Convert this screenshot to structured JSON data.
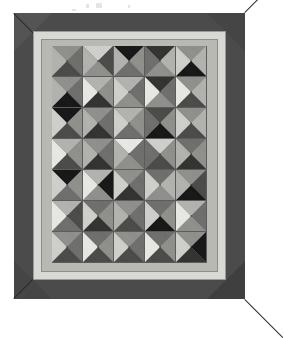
{
  "scene": {
    "title": "Framed geometric grid artwork",
    "background_color": "#ffffff"
  },
  "frame": {
    "name": "picture-frame",
    "color": "#4b4b4b",
    "miter_light_color": "#545454",
    "miter_dark_color": "#3f3f3f",
    "miter_line_color": "#2a2a2a",
    "width_px": 231,
    "height_px": 286
  },
  "mat": {
    "outer_color": "#d8d8d4",
    "outer_edge_color": "#9a9a96",
    "inner_color": "#b9b9b4",
    "inner_edge_color": "#8d8d89"
  },
  "artwork": {
    "label": "pyramid-tile-grid",
    "columns": 5,
    "rows": 7,
    "tile_size_px": 31,
    "grout_color": "#5c5c5c",
    "palette": {
      "white": "#e8e8e4",
      "light": "#cfcfcb",
      "light_mid": "#b2b2ae",
      "mid": "#8f8f8c",
      "mid_dark": "#6e6e6c",
      "dark": "#4a4a49",
      "darker": "#323231",
      "black": "#161616"
    },
    "tiles": [
      {
        "r": 0,
        "c": 0,
        "top": "#8f8f8c",
        "right": "#6e6e6c",
        "bottom": "#4a4a49",
        "left": "#b2b2ae"
      },
      {
        "r": 0,
        "c": 1,
        "top": "#cfcfcb",
        "right": "#4a4a49",
        "bottom": "#8f8f8c",
        "left": "#b2b2ae"
      },
      {
        "r": 0,
        "c": 2,
        "top": "#161616",
        "right": "#8f8f8c",
        "bottom": "#6e6e6c",
        "left": "#b2b2ae"
      },
      {
        "r": 0,
        "c": 3,
        "top": "#323231",
        "right": "#b2b2ae",
        "bottom": "#8f8f8c",
        "left": "#6e6e6c"
      },
      {
        "r": 0,
        "c": 4,
        "top": "#8f8f8c",
        "right": "#b2b2ae",
        "bottom": "#161616",
        "left": "#cfcfcb"
      },
      {
        "r": 1,
        "c": 0,
        "top": "#8f8f8c",
        "right": "#6e6e6c",
        "bottom": "#161616",
        "left": "#b2b2ae"
      },
      {
        "r": 1,
        "c": 1,
        "top": "#b2b2ae",
        "right": "#8f8f8c",
        "bottom": "#323231",
        "left": "#e8e8e4"
      },
      {
        "r": 1,
        "c": 2,
        "top": "#b2b2ae",
        "right": "#6e6e6c",
        "bottom": "#8f8f8c",
        "left": "#cfcfcb"
      },
      {
        "r": 1,
        "c": 3,
        "top": "#323231",
        "right": "#6e6e6c",
        "bottom": "#8f8f8c",
        "left": "#e8e8e4"
      },
      {
        "r": 1,
        "c": 4,
        "top": "#8f8f8c",
        "right": "#b2b2ae",
        "bottom": "#4a4a49",
        "left": "#e8e8e4"
      },
      {
        "r": 2,
        "c": 0,
        "top": "#161616",
        "right": "#8f8f8c",
        "bottom": "#4a4a49",
        "left": "#cfcfcb"
      },
      {
        "r": 2,
        "c": 1,
        "top": "#8f8f8c",
        "right": "#6e6e6c",
        "bottom": "#323231",
        "left": "#b2b2ae"
      },
      {
        "r": 2,
        "c": 2,
        "top": "#b2b2ae",
        "right": "#8f8f8c",
        "bottom": "#6e6e6c",
        "left": "#cfcfcb"
      },
      {
        "r": 2,
        "c": 3,
        "top": "#4a4a49",
        "right": "#8f8f8c",
        "bottom": "#161616",
        "left": "#6e6e6c"
      },
      {
        "r": 2,
        "c": 4,
        "top": "#8f8f8c",
        "right": "#b2b2ae",
        "bottom": "#4a4a49",
        "left": "#cfcfcb"
      },
      {
        "r": 3,
        "c": 0,
        "top": "#b2b2ae",
        "right": "#8f8f8c",
        "bottom": "#4a4a49",
        "left": "#e8e8e4"
      },
      {
        "r": 3,
        "c": 1,
        "top": "#8f8f8c",
        "right": "#6e6e6c",
        "bottom": "#323231",
        "left": "#b2b2ae"
      },
      {
        "r": 3,
        "c": 2,
        "top": "#e8e8e4",
        "right": "#6e6e6c",
        "bottom": "#8f8f8c",
        "left": "#b2b2ae"
      },
      {
        "r": 3,
        "c": 3,
        "top": "#cfcfcb",
        "right": "#8f8f8c",
        "bottom": "#4a4a49",
        "left": "#6e6e6c"
      },
      {
        "r": 3,
        "c": 4,
        "top": "#6e6e6c",
        "right": "#8f8f8c",
        "bottom": "#323231",
        "left": "#b2b2ae"
      },
      {
        "r": 4,
        "c": 0,
        "top": "#161616",
        "right": "#8f8f8c",
        "bottom": "#6e6e6c",
        "left": "#cfcfcb"
      },
      {
        "r": 4,
        "c": 1,
        "top": "#b2b2ae",
        "right": "#161616",
        "bottom": "#8f8f8c",
        "left": "#e8e8e4"
      },
      {
        "r": 4,
        "c": 2,
        "top": "#8f8f8c",
        "right": "#6e6e6c",
        "bottom": "#323231",
        "left": "#cfcfcb"
      },
      {
        "r": 4,
        "c": 3,
        "top": "#6e6e6c",
        "right": "#b2b2ae",
        "bottom": "#8f8f8c",
        "left": "#cfcfcb"
      },
      {
        "r": 4,
        "c": 4,
        "top": "#8f8f8c",
        "right": "#4a4a49",
        "bottom": "#161616",
        "left": "#b2b2ae"
      },
      {
        "r": 5,
        "c": 0,
        "top": "#b2b2ae",
        "right": "#4a4a49",
        "bottom": "#6e6e6c",
        "left": "#e8e8e4"
      },
      {
        "r": 5,
        "c": 1,
        "top": "#6e6e6c",
        "right": "#8f8f8c",
        "bottom": "#323231",
        "left": "#cfcfcb"
      },
      {
        "r": 5,
        "c": 2,
        "top": "#8f8f8c",
        "right": "#6e6e6c",
        "bottom": "#4a4a49",
        "left": "#b2b2ae"
      },
      {
        "r": 5,
        "c": 3,
        "top": "#6e6e6c",
        "right": "#8f8f8c",
        "bottom": "#161616",
        "left": "#cfcfcb"
      },
      {
        "r": 5,
        "c": 4,
        "top": "#b2b2ae",
        "right": "#6e6e6c",
        "bottom": "#8f8f8c",
        "left": "#e8e8e4"
      },
      {
        "r": 6,
        "c": 0,
        "top": "#8f8f8c",
        "right": "#6e6e6c",
        "bottom": "#4a4a49",
        "left": "#cfcfcb"
      },
      {
        "r": 6,
        "c": 1,
        "top": "#6e6e6c",
        "right": "#8f8f8c",
        "bottom": "#4a4a49",
        "left": "#e8e8e4"
      },
      {
        "r": 6,
        "c": 2,
        "top": "#8f8f8c",
        "right": "#6e6e6c",
        "bottom": "#4a4a49",
        "left": "#cfcfcb"
      },
      {
        "r": 6,
        "c": 3,
        "top": "#6e6e6c",
        "right": "#8f8f8c",
        "bottom": "#4a4a49",
        "left": "#e8e8e4"
      },
      {
        "r": 6,
        "c": 4,
        "top": "#8f8f8c",
        "right": "#161616",
        "bottom": "#323231",
        "left": "#cfcfcb"
      }
    ]
  },
  "specks": [
    {
      "x": 86,
      "y": 4,
      "w": 3,
      "h": 4
    },
    {
      "x": 96,
      "y": 3,
      "w": 6,
      "h": 5
    },
    {
      "x": 128,
      "y": 5,
      "w": 2,
      "h": 3
    },
    {
      "x": 72,
      "y": 9,
      "w": 4,
      "h": 2
    }
  ]
}
